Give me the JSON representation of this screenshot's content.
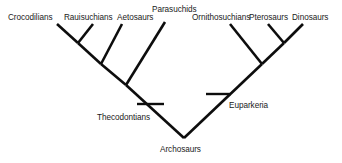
{
  "figure": {
    "kind": "cladogram",
    "background_color": "#ffffff",
    "line_color": "#0d0d0d",
    "text_color": "#1a1a1a"
  },
  "tip_labels": [
    {
      "name": "crocodilians",
      "text": "Crocodilians",
      "x": 8,
      "y": 13
    },
    {
      "name": "rauisuchians",
      "text": "Rauisuchians",
      "x": 64,
      "y": 13
    },
    {
      "name": "aetosaurs",
      "text": "Aetosaurs",
      "x": 117,
      "y": 13
    },
    {
      "name": "parasuchids",
      "text": "Parasuchids",
      "x": 152,
      "y": 5
    },
    {
      "name": "ornithosuchians",
      "text": "Ornithosuchians",
      "x": 192,
      "y": 13
    },
    {
      "name": "pterosaurs",
      "text": "Pterosaurs",
      "x": 249,
      "y": 13
    },
    {
      "name": "dinosaurs",
      "text": "Dinosaurs",
      "x": 292,
      "y": 13
    }
  ],
  "node_labels": [
    {
      "name": "thecodontians",
      "text": "Thecodontians",
      "x": 97,
      "y": 113
    },
    {
      "name": "euparkeria",
      "text": "Euparkeria",
      "x": 229,
      "y": 101
    },
    {
      "name": "archosaurs",
      "text": "Archosaurs",
      "x": 160,
      "y": 145
    }
  ],
  "branches": [
    {
      "name": "branch-crocodilians",
      "x1": 57,
      "y1": 24,
      "x2": 78,
      "y2": 43
    },
    {
      "name": "branch-rauisuchians",
      "x1": 93,
      "y1": 24,
      "x2": 78,
      "y2": 43
    },
    {
      "name": "branch-croc-raui-stem",
      "x1": 78,
      "y1": 43,
      "x2": 101,
      "y2": 64
    },
    {
      "name": "branch-aetosaurs",
      "x1": 122,
      "y1": 24,
      "x2": 101,
      "y2": 64
    },
    {
      "name": "branch-aeto-clade-stem",
      "x1": 101,
      "y1": 64,
      "x2": 126,
      "y2": 85
    },
    {
      "name": "branch-parasuchids",
      "x1": 165,
      "y1": 22,
      "x2": 126,
      "y2": 85
    },
    {
      "name": "branch-thecodontians-stem",
      "x1": 126,
      "y1": 85,
      "x2": 184,
      "y2": 138
    },
    {
      "name": "branch-ornithosuchians",
      "x1": 230,
      "y1": 24,
      "x2": 262,
      "y2": 64
    },
    {
      "name": "branch-pterosaurs",
      "x1": 268,
      "y1": 24,
      "x2": 284,
      "y2": 43
    },
    {
      "name": "branch-dinosaurs",
      "x1": 303,
      "y1": 24,
      "x2": 284,
      "y2": 43
    },
    {
      "name": "branch-ptero-dino-stem",
      "x1": 284,
      "y1": 43,
      "x2": 262,
      "y2": 64
    },
    {
      "name": "branch-euparkeria-stem",
      "x1": 262,
      "y1": 64,
      "x2": 184,
      "y2": 138
    }
  ],
  "tick_marks": [
    {
      "name": "tick-thecodontians",
      "x1": 137,
      "y1": 104,
      "x2": 164,
      "y2": 104
    },
    {
      "name": "tick-euparkeria",
      "x1": 206,
      "y1": 94,
      "x2": 231,
      "y2": 94
    }
  ]
}
